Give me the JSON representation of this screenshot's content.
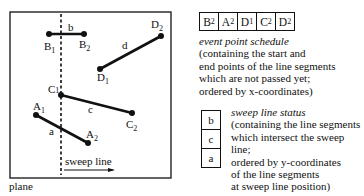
{
  "plane": {
    "label": "plane",
    "sweep_line_label": "sweep line",
    "segments": [
      {
        "name": "a",
        "start": "A1",
        "end": "A2"
      },
      {
        "name": "b",
        "start": "B1",
        "end": "B2"
      },
      {
        "name": "c",
        "start": "C1",
        "end": "C2"
      },
      {
        "name": "d",
        "start": "D1",
        "end": "D2"
      }
    ],
    "point_labels": {
      "A": "A",
      "B": "B",
      "C": "C",
      "D": "D",
      "one": "1",
      "two": "2"
    },
    "segment_labels": {
      "a": "a",
      "b": "b",
      "c": "c",
      "d": "d"
    }
  },
  "event_schedule": {
    "cells": [
      {
        "letter": "B",
        "sub": "2"
      },
      {
        "letter": "A",
        "sub": "2"
      },
      {
        "letter": "D",
        "sub": "1"
      },
      {
        "letter": "C",
        "sub": "2"
      },
      {
        "letter": "D",
        "sub": "2"
      }
    ],
    "title": "event point schedule",
    "lines": [
      "(containing the start and",
      "end points of the line segments",
      "which are not passed yet;",
      "ordered by x-coordinates)"
    ]
  },
  "sweep_status": {
    "cells": [
      "b",
      "c",
      "a"
    ],
    "title": "sweep line status",
    "lines": [
      "(containing the line segments",
      "which intersect the sweep line;",
      "ordered by y-coordinates",
      "of the line segments",
      "at sweep line position)"
    ]
  }
}
